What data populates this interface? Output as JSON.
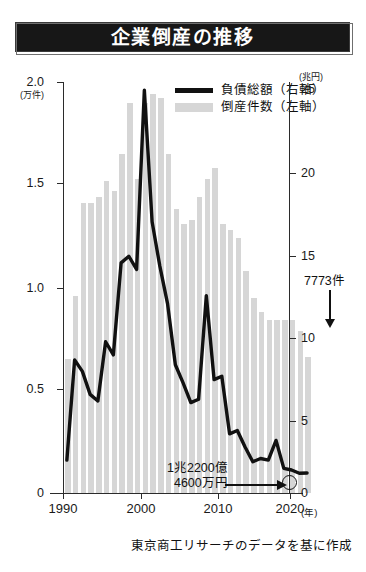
{
  "title": "企業倒産の推移",
  "legend": [
    {
      "label": "負債総額（右軸）",
      "style": "line",
      "color": "#111111"
    },
    {
      "label": "倒産件数（左軸）",
      "style": "bar",
      "color": "#d6d6d6"
    }
  ],
  "axes": {
    "left_unit": "(万件)",
    "right_unit": "(兆円)",
    "x_unit": "(年)",
    "left_ticks": [
      "2.0",
      "1.5",
      "1.0",
      "0.5",
      "0"
    ],
    "right_ticks": [
      "25",
      "20",
      "15",
      "10",
      "5",
      "0"
    ],
    "x_ticks": [
      "1990",
      "2000",
      "2010",
      "2020"
    ]
  },
  "annotations": {
    "cases": "7773件",
    "liabilities_line1": "1兆2200億",
    "liabilities_line2": "4600万円"
  },
  "source": "東京商工リサーチのデータを基に作成",
  "chart_data": {
    "type": "bar",
    "title": "企業倒産の推移",
    "xlabel": "(年)",
    "ylabel": "倒産件数 (万件)",
    "y2label": "負債総額 (兆円)",
    "ylim": [
      0,
      2.0
    ],
    "y2lim": [
      0,
      25
    ],
    "xlim": [
      1990,
      2021
    ],
    "grid": false,
    "legend_position": "top-right",
    "x": [
      1990,
      1991,
      1992,
      1993,
      1994,
      1995,
      1996,
      1997,
      1998,
      1999,
      2000,
      2001,
      2002,
      2003,
      2004,
      2005,
      2006,
      2007,
      2008,
      2009,
      2010,
      2011,
      2012,
      2013,
      2014,
      2015,
      2016,
      2017,
      2018,
      2019,
      2020,
      2021
    ],
    "series": [
      {
        "name": "倒産件数（左軸）",
        "type": "bar",
        "unit": "万件",
        "axis": "left",
        "color": "#d6d6d6",
        "values": [
          0.65,
          0.96,
          1.41,
          1.41,
          1.44,
          1.52,
          1.47,
          1.65,
          1.9,
          1.53,
          1.9,
          1.94,
          1.92,
          1.65,
          1.38,
          1.31,
          1.33,
          1.44,
          1.53,
          1.58,
          1.31,
          1.28,
          1.24,
          1.08,
          0.95,
          0.88,
          0.84,
          0.84,
          0.84,
          0.84,
          0.79,
          0.66
        ]
      },
      {
        "name": "負債総額（右軸）",
        "type": "line",
        "unit": "兆円",
        "axis": "right",
        "color": "#111111",
        "values": [
          2.0,
          8.1,
          7.4,
          6.0,
          5.6,
          9.2,
          8.4,
          14.0,
          14.4,
          13.6,
          24.5,
          16.5,
          13.8,
          11.5,
          7.8,
          6.7,
          5.5,
          5.7,
          12.0,
          6.9,
          7.1,
          3.6,
          3.8,
          2.8,
          1.9,
          2.1,
          2.0,
          3.2,
          1.5,
          1.4,
          1.2,
          1.22
        ]
      }
    ],
    "highlighted_points": [
      {
        "label": "7773件",
        "series": "倒産件数（左軸）",
        "x": 2021,
        "value": 0.7773,
        "unit": "件"
      },
      {
        "label": "1兆2200億4600万円",
        "series": "負債総額（右軸）",
        "x": 2021,
        "value": 1.22046,
        "unit": "兆円"
      }
    ]
  }
}
